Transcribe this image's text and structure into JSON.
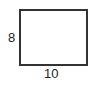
{
  "diagram": {
    "shape": "rectangle",
    "stroke_color": "#333333",
    "fill_color": "#ffffff",
    "labels": {
      "height": "8",
      "width": "10"
    }
  }
}
